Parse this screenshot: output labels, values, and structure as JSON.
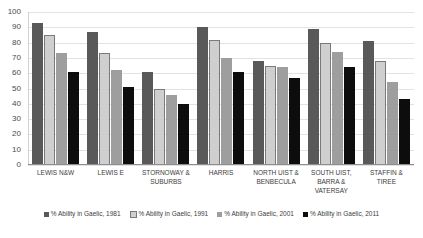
{
  "chart_data": {
    "type": "bar",
    "title": "",
    "xlabel": "",
    "ylabel": "",
    "ylim": [
      0,
      100
    ],
    "yticks": [
      100,
      90,
      80,
      70,
      60,
      50,
      40,
      30,
      20,
      10,
      0
    ],
    "grid": true,
    "legend_position": "bottom",
    "categories": [
      "LEWIS N&W",
      "LEWIS E",
      "STORNOWAY & SUBURBS",
      "HARRIS",
      "NORTH UIST & BENBECULA",
      "SOUTH UIST, BARRA & VATERSAY",
      "STAFFIN & TIREE"
    ],
    "series": [
      {
        "name": "% Ability in Gaelic, 1981",
        "color": "#595959",
        "values": [
          93,
          87,
          61,
          90,
          68,
          89,
          81
        ]
      },
      {
        "name": "% Ability in Gaelic, 1991",
        "color": "#cfcfcf",
        "values": [
          85,
          73,
          50,
          82,
          65,
          80,
          68
        ]
      },
      {
        "name": "% Ability in Gaelic, 2001",
        "color": "#9e9e9e",
        "values": [
          73,
          62,
          46,
          70,
          64,
          74,
          54
        ]
      },
      {
        "name": "% Ability in Gaelic, 2011",
        "color": "#0d0d0d",
        "values": [
          61,
          51,
          40,
          61,
          57,
          64,
          43
        ]
      }
    ]
  }
}
